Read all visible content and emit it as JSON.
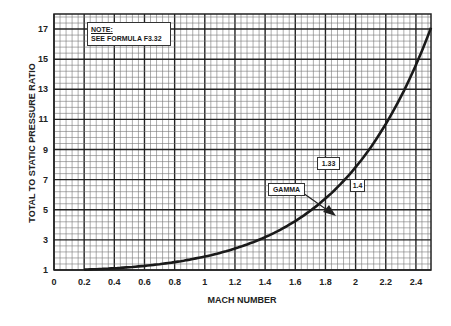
{
  "chart_data": {
    "type": "line",
    "title": "",
    "xlabel": "MACH NUMBER",
    "ylabel": "TOTAL TO STATIC PRESSURE RATIO",
    "xlim": [
      0,
      2.5
    ],
    "ylim": [
      1,
      18
    ],
    "grid": true,
    "x_ticks": [
      "0",
      "0.2",
      "0.4",
      "0.6",
      "0.8",
      "1",
      "1.2",
      "1.4",
      "1.6",
      "1.8",
      "2",
      "2.2",
      "2.4"
    ],
    "y_ticks": [
      "1",
      "3",
      "5",
      "7",
      "9",
      "11",
      "13",
      "15",
      "17"
    ],
    "x": [
      0,
      0.2,
      0.4,
      0.6,
      0.8,
      1.0,
      1.2,
      1.4,
      1.6,
      1.8,
      2.0,
      2.2,
      2.4,
      2.5
    ],
    "series": [
      {
        "name": "1.4",
        "values": [
          1.0,
          1.03,
          1.12,
          1.28,
          1.52,
          1.89,
          2.42,
          3.18,
          4.25,
          5.75,
          7.82,
          10.69,
          14.62,
          17.09
        ]
      },
      {
        "name": "1.33",
        "values": [
          1.0,
          1.03,
          1.11,
          1.27,
          1.51,
          1.85,
          2.36,
          3.1,
          4.14,
          5.59,
          7.71,
          10.6,
          14.6,
          17.2
        ]
      }
    ],
    "annotations": {
      "note_title": "NOTE:",
      "note_text": "SEE FORMULA F3.32",
      "legend_title": "GAMMA",
      "gamma_labels": [
        "1.33",
        "1.4"
      ]
    }
  }
}
